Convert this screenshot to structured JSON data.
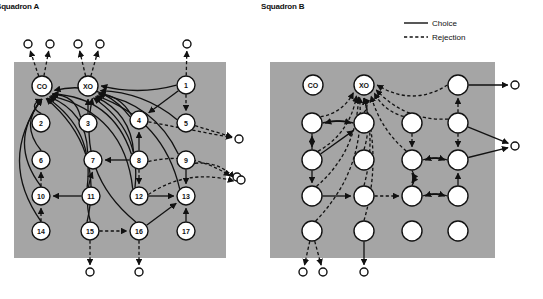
{
  "figure": {
    "type": "sociogram-network-diagram",
    "panels": [
      {
        "id": "A",
        "title": "Squadron A",
        "plate": {
          "x": 14,
          "y": 62,
          "w": 212,
          "h": 196,
          "color": "#a5a5a5"
        },
        "nodes": [
          {
            "id": "CO",
            "label": "CO",
            "x": 42,
            "y": 86,
            "r": 10
          },
          {
            "id": "XO",
            "label": "XO",
            "x": 88,
            "y": 86,
            "r": 10
          },
          {
            "id": "1",
            "label": "1",
            "x": 186,
            "y": 85,
            "r": 9
          },
          {
            "id": "2",
            "label": "2",
            "x": 41,
            "y": 123,
            "r": 9
          },
          {
            "id": "3",
            "label": "3",
            "x": 88,
            "y": 123,
            "r": 9
          },
          {
            "id": "4",
            "label": "4",
            "x": 139,
            "y": 120,
            "r": 9
          },
          {
            "id": "5",
            "label": "5",
            "x": 186,
            "y": 123,
            "r": 9
          },
          {
            "id": "6",
            "label": "6",
            "x": 41,
            "y": 160,
            "r": 9
          },
          {
            "id": "7",
            "label": "7",
            "x": 93,
            "y": 160,
            "r": 9
          },
          {
            "id": "8",
            "label": "8",
            "x": 139,
            "y": 160,
            "r": 9
          },
          {
            "id": "9",
            "label": "9",
            "x": 186,
            "y": 160,
            "r": 9
          },
          {
            "id": "10",
            "label": "10",
            "x": 41,
            "y": 196,
            "r": 9
          },
          {
            "id": "11",
            "label": "11",
            "x": 91,
            "y": 196,
            "r": 9
          },
          {
            "id": "12",
            "label": "12",
            "x": 139,
            "y": 196,
            "r": 9
          },
          {
            "id": "13",
            "label": "13",
            "x": 186,
            "y": 196,
            "r": 9
          },
          {
            "id": "14",
            "label": "14",
            "x": 41,
            "y": 231,
            "r": 9
          },
          {
            "id": "15",
            "label": "15",
            "x": 90,
            "y": 231,
            "r": 9
          },
          {
            "id": "16",
            "label": "16",
            "x": 139,
            "y": 231,
            "r": 9
          },
          {
            "id": "17",
            "label": "17",
            "x": 186,
            "y": 231,
            "r": 9
          }
        ],
        "external": [
          {
            "id": "eA1",
            "x": 28,
            "y": 44,
            "r": 4
          },
          {
            "id": "eA2",
            "x": 50,
            "y": 44,
            "r": 4
          },
          {
            "id": "eA3",
            "x": 78,
            "y": 44,
            "r": 4
          },
          {
            "id": "eA4",
            "x": 100,
            "y": 44,
            "r": 4
          },
          {
            "id": "eA5",
            "x": 187,
            "y": 44,
            "r": 4
          },
          {
            "id": "eA6",
            "x": 239,
            "y": 139,
            "r": 4
          },
          {
            "id": "eA7",
            "x": 237,
            "y": 177,
            "r": 4
          },
          {
            "id": "eA8",
            "x": 241,
            "y": 180,
            "r": 4
          },
          {
            "id": "eA9",
            "x": 90,
            "y": 272,
            "r": 4
          },
          {
            "id": "eA10",
            "x": 139,
            "y": 272,
            "r": 4
          }
        ],
        "edges": [
          {
            "from": "2",
            "to": "CO",
            "kind": "choice",
            "curve": -14
          },
          {
            "from": "6",
            "to": "CO",
            "kind": "choice",
            "curve": -22
          },
          {
            "from": "10",
            "to": "CO",
            "kind": "choice",
            "curve": -34
          },
          {
            "from": "14",
            "to": "CO",
            "kind": "choice",
            "curve": -44
          },
          {
            "from": "3",
            "to": "CO",
            "kind": "choice",
            "curve": 14
          },
          {
            "from": "7",
            "to": "CO",
            "kind": "choice",
            "curve": 22
          },
          {
            "from": "11",
            "to": "CO",
            "kind": "choice",
            "curve": 30
          },
          {
            "from": "15",
            "to": "CO",
            "kind": "choice",
            "curve": 40
          },
          {
            "from": "4",
            "to": "CO",
            "kind": "choice",
            "curve": 26
          },
          {
            "from": "8",
            "to": "CO",
            "kind": "choice",
            "curve": 34
          },
          {
            "from": "12",
            "to": "CO",
            "kind": "choice",
            "curve": 44
          },
          {
            "from": "1",
            "to": "XO",
            "kind": "choice",
            "curve": -10
          },
          {
            "from": "5",
            "to": "XO",
            "kind": "choice",
            "curve": 14
          },
          {
            "from": "9",
            "to": "XO",
            "kind": "choice",
            "curve": 26
          },
          {
            "from": "13",
            "to": "XO",
            "kind": "choice",
            "curve": 34
          },
          {
            "from": "3",
            "to": "XO",
            "kind": "choice",
            "curve": 0
          },
          {
            "from": "4",
            "to": "XO",
            "kind": "choice",
            "curve": 10
          },
          {
            "from": "8",
            "to": "XO",
            "kind": "choice",
            "curve": 20
          },
          {
            "from": "12",
            "to": "XO",
            "kind": "choice",
            "curve": 30
          },
          {
            "from": "16",
            "to": "XO",
            "kind": "choice",
            "curve": -40
          },
          {
            "from": "1",
            "to": "4",
            "kind": "choice",
            "curve": 0
          },
          {
            "from": "11",
            "to": "10",
            "kind": "choice",
            "curve": 0
          },
          {
            "from": "8",
            "to": "7",
            "kind": "choice",
            "curve": 0
          },
          {
            "from": "8",
            "to": "4",
            "kind": "choice",
            "curve": 0
          },
          {
            "from": "12",
            "to": "13",
            "kind": "choice",
            "curve": 0
          },
          {
            "from": "9",
            "to": "13",
            "kind": "choice",
            "curve": 0
          },
          {
            "from": "17",
            "to": "13",
            "kind": "choice",
            "curve": 0
          },
          {
            "from": "16",
            "to": "13",
            "kind": "choice",
            "curve": 0
          },
          {
            "from": "15",
            "to": "7",
            "kind": "choice",
            "curve": -8
          },
          {
            "from": "CO",
            "to": "eA1",
            "kind": "rejection",
            "curve": 0
          },
          {
            "from": "CO",
            "to": "eA2",
            "kind": "rejection",
            "curve": 0
          },
          {
            "from": "XO",
            "to": "eA3",
            "kind": "rejection",
            "curve": 0
          },
          {
            "from": "XO",
            "to": "eA4",
            "kind": "rejection",
            "curve": 0
          },
          {
            "from": "1",
            "to": "eA5",
            "kind": "rejection",
            "curve": 0
          },
          {
            "from": "1",
            "to": "5",
            "kind": "rejection",
            "curve": 0
          },
          {
            "from": "5",
            "to": "eA6",
            "kind": "rejection",
            "curve": 0
          },
          {
            "from": "4",
            "to": "eA6",
            "kind": "rejection",
            "curve": 0
          },
          {
            "from": "8",
            "to": "eA7",
            "kind": "rejection",
            "curve": -18
          },
          {
            "from": "8",
            "to": "12",
            "kind": "rejection",
            "curve": 0
          },
          {
            "from": "9",
            "to": "eA8",
            "kind": "rejection",
            "curve": -10
          },
          {
            "from": "12",
            "to": "eA8",
            "kind": "rejection",
            "curve": -20
          },
          {
            "from": "10",
            "to": "6",
            "kind": "rejection",
            "curve": 0
          },
          {
            "from": "14",
            "to": "10",
            "kind": "rejection",
            "curve": 0
          },
          {
            "from": "15",
            "to": "16",
            "kind": "rejection",
            "curve": 0
          },
          {
            "from": "15",
            "to": "eA9",
            "kind": "rejection",
            "curve": 0
          },
          {
            "from": "16",
            "to": "eA10",
            "kind": "rejection",
            "curve": 0
          }
        ]
      },
      {
        "id": "B",
        "title": "Squadron B",
        "plate": {
          "x": 270,
          "y": 62,
          "w": 225,
          "h": 196,
          "color": "#a5a5a5"
        },
        "nodes": [
          {
            "id": "BCO",
            "label": "CO",
            "x": 313,
            "y": 85,
            "r": 10
          },
          {
            "id": "BXO",
            "label": "XO",
            "x": 364,
            "y": 85,
            "r": 10
          },
          {
            "id": "B1",
            "label": "",
            "x": 458,
            "y": 85,
            "r": 10
          },
          {
            "id": "B2",
            "label": "",
            "x": 312,
            "y": 123,
            "r": 10
          },
          {
            "id": "B3",
            "label": "",
            "x": 364,
            "y": 123,
            "r": 10
          },
          {
            "id": "B4",
            "label": "",
            "x": 412,
            "y": 123,
            "r": 10
          },
          {
            "id": "B5",
            "label": "",
            "x": 458,
            "y": 123,
            "r": 10
          },
          {
            "id": "B6",
            "label": "",
            "x": 312,
            "y": 160,
            "r": 10
          },
          {
            "id": "B7",
            "label": "",
            "x": 364,
            "y": 160,
            "r": 10
          },
          {
            "id": "B8",
            "label": "",
            "x": 412,
            "y": 160,
            "r": 10
          },
          {
            "id": "B9",
            "label": "",
            "x": 458,
            "y": 160,
            "r": 10
          },
          {
            "id": "B10",
            "label": "",
            "x": 312,
            "y": 196,
            "r": 10
          },
          {
            "id": "B11",
            "label": "",
            "x": 364,
            "y": 196,
            "r": 10
          },
          {
            "id": "B12",
            "label": "",
            "x": 412,
            "y": 196,
            "r": 10
          },
          {
            "id": "B13",
            "label": "",
            "x": 458,
            "y": 196,
            "r": 10
          },
          {
            "id": "B14",
            "label": "",
            "x": 312,
            "y": 231,
            "r": 10
          },
          {
            "id": "B15",
            "label": "",
            "x": 364,
            "y": 231,
            "r": 10
          },
          {
            "id": "B16",
            "label": "",
            "x": 412,
            "y": 231,
            "r": 10
          },
          {
            "id": "B17",
            "label": "",
            "x": 458,
            "y": 231,
            "r": 10
          }
        ],
        "external": [
          {
            "id": "eB1",
            "x": 515,
            "y": 85,
            "r": 4
          },
          {
            "id": "eB2",
            "x": 515,
            "y": 146,
            "r": 4
          },
          {
            "id": "eB3",
            "x": 303,
            "y": 272,
            "r": 4
          },
          {
            "id": "eB4",
            "x": 323,
            "y": 272,
            "r": 4
          },
          {
            "id": "eB5",
            "x": 364,
            "y": 272,
            "r": 4
          }
        ],
        "edges": [
          {
            "from": "B1",
            "to": "eB1",
            "kind": "choice",
            "curve": 0
          },
          {
            "from": "B5",
            "to": "eB2",
            "kind": "choice",
            "curve": 0
          },
          {
            "from": "B9",
            "to": "eB2",
            "kind": "choice",
            "curve": 0
          },
          {
            "from": "B5",
            "to": "B1",
            "kind": "rejection",
            "curve": 0
          },
          {
            "from": "B1",
            "to": "BXO",
            "kind": "rejection",
            "curve": -22
          },
          {
            "from": "B5",
            "to": "BXO",
            "kind": "rejection",
            "curve": -18
          },
          {
            "from": "B2",
            "to": "BXO",
            "kind": "rejection",
            "curve": 10
          },
          {
            "from": "B3",
            "to": "BXO",
            "kind": "rejection",
            "curve": 6
          },
          {
            "from": "B4",
            "to": "BXO",
            "kind": "rejection",
            "curve": -8
          },
          {
            "from": "B6",
            "to": "BXO",
            "kind": "rejection",
            "curve": 16
          },
          {
            "from": "B7",
            "to": "BXO",
            "kind": "rejection",
            "curve": 8
          },
          {
            "from": "B8",
            "to": "BXO",
            "kind": "rejection",
            "curve": -10
          },
          {
            "from": "B10",
            "to": "BXO",
            "kind": "rejection",
            "curve": 22
          },
          {
            "from": "B11",
            "to": "BXO",
            "kind": "rejection",
            "curve": 12
          },
          {
            "from": "B14",
            "to": "BXO",
            "kind": "rejection",
            "curve": 30
          },
          {
            "from": "B15",
            "to": "BXO",
            "kind": "rejection",
            "curve": 18
          },
          {
            "from": "B2",
            "to": "B3",
            "kind": "choice",
            "curve": -4
          },
          {
            "from": "B3",
            "to": "B2",
            "kind": "choice",
            "curve": 4
          },
          {
            "from": "B6",
            "to": "B2",
            "kind": "choice",
            "curve": 0
          },
          {
            "from": "B2",
            "to": "B6",
            "kind": "rejection",
            "curve": 0
          },
          {
            "from": "B6",
            "to": "B3",
            "kind": "choice",
            "curve": 0
          },
          {
            "from": "B6",
            "to": "B10",
            "kind": "choice",
            "curve": 0
          },
          {
            "from": "B10",
            "to": "B11",
            "kind": "choice",
            "curve": 0
          },
          {
            "from": "B11",
            "to": "B12",
            "kind": "rejection",
            "curve": 0
          },
          {
            "from": "B4",
            "to": "B8",
            "kind": "rejection",
            "curve": 0
          },
          {
            "from": "B5",
            "to": "B9",
            "kind": "rejection",
            "curve": 0
          },
          {
            "from": "B8",
            "to": "B9",
            "kind": "choice",
            "curve": -4
          },
          {
            "from": "B9",
            "to": "B8",
            "kind": "choice",
            "curve": 4
          },
          {
            "from": "B8",
            "to": "B12",
            "kind": "choice",
            "curve": -4
          },
          {
            "from": "B12",
            "to": "B8",
            "kind": "choice",
            "curve": 4
          },
          {
            "from": "B12",
            "to": "B13",
            "kind": "choice",
            "curve": -4
          },
          {
            "from": "B13",
            "to": "B12",
            "kind": "choice",
            "curve": 4
          },
          {
            "from": "B13",
            "to": "B9",
            "kind": "choice",
            "curve": 0
          },
          {
            "from": "B14",
            "to": "eB3",
            "kind": "rejection",
            "curve": 0
          },
          {
            "from": "B14",
            "to": "eB4",
            "kind": "rejection",
            "curve": 0
          },
          {
            "from": "B15",
            "to": "eB5",
            "kind": "choice",
            "curve": 0
          }
        ]
      }
    ],
    "legend": {
      "items": [
        {
          "label": "Choice",
          "kind": "choice"
        },
        {
          "label": "Rejection",
          "kind": "rejection"
        }
      ]
    },
    "colors": {
      "plate": "#a5a5a5",
      "ink": "#111111",
      "node_fill": "#ffffff"
    }
  }
}
